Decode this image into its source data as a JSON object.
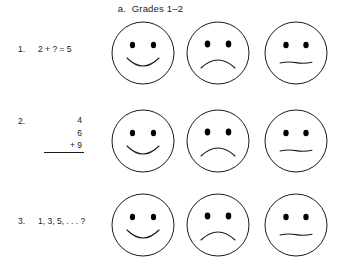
{
  "figure": {
    "title": "a.  Grades 1–2",
    "ink_color": "#1a1a1a",
    "background_color": "#ffffff"
  },
  "rows": [
    {
      "number": "1.",
      "expression": "2 + ? = 5",
      "layout": "inline",
      "faces": [
        "happy-face",
        "sad-face",
        "neutral-face"
      ]
    },
    {
      "number": "2.",
      "layout": "stacked-addition",
      "addend_1": "4",
      "addend_2": "6",
      "addend_3": "+ 9",
      "faces": [
        "happy-face",
        "sad-face",
        "neutral-face"
      ]
    },
    {
      "number": "3.",
      "expression": "1, 3, 5, . . . ?",
      "layout": "inline",
      "faces": [
        "happy-face",
        "sad-face",
        "neutral-face"
      ]
    }
  ],
  "face_labels": {
    "happy": "happy-face",
    "sad": "sad-face",
    "neutral": "neutral-face"
  }
}
